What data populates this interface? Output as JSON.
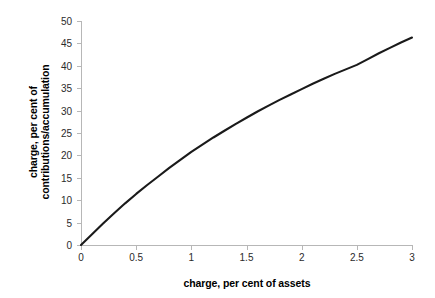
{
  "chart_data": {
    "type": "line",
    "title": "",
    "subtitle": "",
    "xlabel": "charge, per cent of assets",
    "ylabel_lines": [
      "charge, per cent of",
      "contributions/accumulation"
    ],
    "ylabel": "charge, per cent of contributions/accumulation",
    "xlim": [
      0,
      3
    ],
    "ylim": [
      0,
      50
    ],
    "xticks": [
      0,
      0.5,
      1,
      1.5,
      2,
      2.5,
      3
    ],
    "xtick_labels": [
      "0",
      "0.5",
      "1",
      "1.5",
      "2",
      "2.5",
      "3"
    ],
    "yticks": [
      0,
      5,
      10,
      15,
      20,
      25,
      30,
      35,
      40,
      45,
      50
    ],
    "ytick_labels": [
      "0",
      "5",
      "10",
      "15",
      "20",
      "25",
      "30",
      "35",
      "40",
      "45",
      "50"
    ],
    "grid": false,
    "legend": false,
    "legend_position": "none",
    "series": [
      {
        "name": "charge ratio",
        "color": "#1a1a1a",
        "line_width": 2.1,
        "x": [
          0,
          0.1,
          0.2,
          0.3,
          0.4,
          0.5,
          0.6,
          0.7,
          0.8,
          0.9,
          1.0,
          1.1,
          1.2,
          1.3,
          1.4,
          1.5,
          1.6,
          1.7,
          1.8,
          1.9,
          2.0,
          2.1,
          2.2,
          2.3,
          2.4,
          2.5,
          2.6,
          2.7,
          2.8,
          2.9,
          3.0
        ],
        "values": [
          0,
          2.4,
          4.8,
          7.1,
          9.3,
          11.4,
          13.4,
          15.3,
          17.2,
          19.0,
          20.8,
          22.4,
          24.0,
          25.5,
          27.0,
          28.4,
          29.8,
          31.1,
          32.4,
          33.6,
          34.8,
          36.0,
          37.1,
          38.2,
          39.2,
          40.2,
          41.5,
          42.8,
          44.0,
          45.2,
          46.3
        ]
      }
    ]
  },
  "axis": {
    "line_color": "#b7b7b7",
    "tick_color": "#b7b7b7",
    "label_color": "#2b2b2b"
  }
}
